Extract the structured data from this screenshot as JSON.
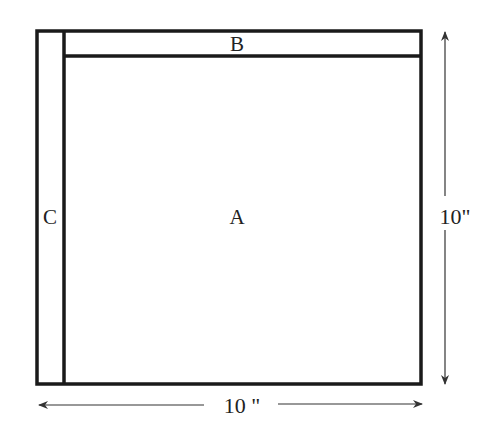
{
  "diagram": {
    "regions": {
      "a": {
        "label": "A"
      },
      "b": {
        "label": "B"
      },
      "c": {
        "label": "C"
      }
    },
    "dimensions": {
      "height": {
        "label": "10\""
      },
      "width": {
        "label": "10 \""
      }
    }
  }
}
